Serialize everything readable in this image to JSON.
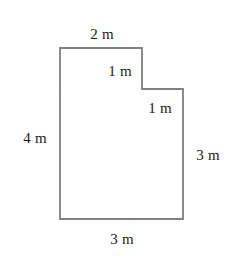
{
  "figure": {
    "name": "composite-rectilinear-shape",
    "unit": "m",
    "canvas": {
      "width": 245,
      "height": 258
    },
    "style": {
      "background_color": "#ffffff",
      "outline_color": "#808080",
      "outline_width": 1.8,
      "fill_color": "#ffffff",
      "label_color": "#1a1a1a",
      "label_font_size": 15
    },
    "vertices": [
      {
        "name": "top-left",
        "x": 60,
        "y": 48
      },
      {
        "name": "top-right-of-upper-section",
        "x": 142,
        "y": 48
      },
      {
        "name": "step-inner-corner",
        "x": 142,
        "y": 89
      },
      {
        "name": "step-outer-top-right",
        "x": 183,
        "y": 89
      },
      {
        "name": "bottom-right",
        "x": 183,
        "y": 219
      },
      {
        "name": "bottom-left",
        "x": 60,
        "y": 219
      }
    ],
    "edges": [
      {
        "name": "top-edge",
        "length": 2,
        "label": "2 m",
        "orientation": "horizontal"
      },
      {
        "name": "upper-right-vertical-edge",
        "length": 1,
        "label": "1 m",
        "orientation": "vertical"
      },
      {
        "name": "step-horizontal-edge",
        "length": 1,
        "label": "1 m",
        "orientation": "horizontal"
      },
      {
        "name": "left-edge",
        "length": 4,
        "label": "4 m",
        "orientation": "vertical"
      },
      {
        "name": "right-edge",
        "length": 3,
        "label": "3 m",
        "orientation": "vertical"
      },
      {
        "name": "bottom-edge",
        "length": 3,
        "label": "3 m",
        "orientation": "horizontal"
      }
    ],
    "labels": [
      {
        "key": "top",
        "text": "2 m",
        "x": 102,
        "y": 34
      },
      {
        "key": "upper_step_vertical",
        "text": "1 m",
        "x": 120,
        "y": 71
      },
      {
        "key": "step_horizontal",
        "text": "1 m",
        "x": 160,
        "y": 108
      },
      {
        "key": "left",
        "text": "4 m",
        "x": 35,
        "y": 138
      },
      {
        "key": "right",
        "text": "3 m",
        "x": 208,
        "y": 155
      },
      {
        "key": "bottom",
        "text": "3 m",
        "x": 122,
        "y": 239
      }
    ]
  },
  "chart_data": {
    "type": "diagram",
    "subtype": "geometric-polygon",
    "title": "",
    "unit": "m",
    "shape": "stepped rectilinear hexagon",
    "polygon_points": [
      [
        60,
        48
      ],
      [
        142,
        48
      ],
      [
        142,
        89
      ],
      [
        183,
        89
      ],
      [
        183,
        219
      ],
      [
        60,
        219
      ]
    ],
    "side_lengths": [
      2,
      1,
      1,
      3,
      3,
      4
    ],
    "side_labels": [
      "2 m",
      "1 m",
      "1 m",
      "3 m",
      "3 m",
      "4 m"
    ],
    "annotations": [
      "2 m",
      "1 m",
      "1 m",
      "4 m",
      "3 m",
      "3 m"
    ]
  }
}
